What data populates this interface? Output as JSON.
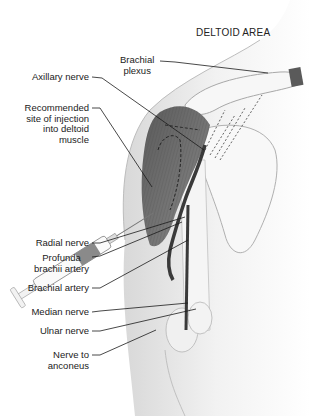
{
  "title": "DELTOID AREA",
  "labels": {
    "brachial_plexus": [
      "Brachial",
      "plexus"
    ],
    "axillary_nerve": [
      "Axillary nerve"
    ],
    "injection_site": [
      "Recommended",
      "site of injection",
      "into deltoid",
      "muscle"
    ],
    "radial_nerve": [
      "Radial nerve"
    ],
    "profunda_brachii_artery": [
      "Profunda",
      "brachii artery"
    ],
    "brachial_artery": [
      "Brachial artery"
    ],
    "median_nerve": [
      "Median nerve"
    ],
    "ulnar_nerve": [
      "Ulnar nerve"
    ],
    "nerve_to_anconeus": [
      "Nerve to",
      "anconeus"
    ]
  },
  "colors": {
    "muscle": "#6e6e6e",
    "skin": "#efefef",
    "bone": "#f7f7f7",
    "artery": "#3a3a3a",
    "leader": "#1a1a1a"
  }
}
